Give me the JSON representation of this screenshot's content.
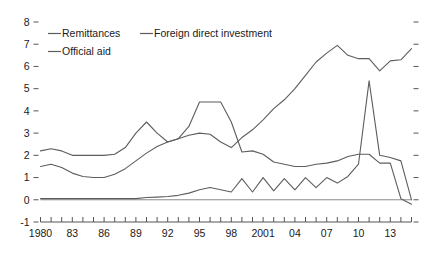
{
  "chart_data": {
    "type": "line",
    "title": "",
    "xlabel": "",
    "ylabel": "",
    "xlim": [
      1980,
      2015
    ],
    "ylim": [
      -1,
      8
    ],
    "ytick_values": [
      -1,
      0,
      1,
      2,
      3,
      4,
      5,
      6,
      7,
      8
    ],
    "ytick_labels": [
      "-1",
      "0",
      "1",
      "2",
      "3",
      "4",
      "5",
      "6",
      "7",
      "8"
    ],
    "xtick_values": [
      1980,
      1983,
      1986,
      1989,
      1992,
      1995,
      1998,
      2001,
      2004,
      2007,
      2010,
      2013
    ],
    "xtick_labels": [
      "1980",
      "83",
      "86",
      "89",
      "92",
      "95",
      "98",
      "2001",
      "04",
      "07",
      "10",
      "13"
    ],
    "x": [
      1980,
      1981,
      1982,
      1983,
      1984,
      1985,
      1986,
      1987,
      1988,
      1989,
      1990,
      1991,
      1992,
      1993,
      1994,
      1995,
      1996,
      1997,
      1998,
      1999,
      2000,
      2001,
      2002,
      2003,
      2004,
      2005,
      2006,
      2007,
      2008,
      2009,
      2010,
      2011,
      2012,
      2013,
      2014,
      2015
    ],
    "grid": false,
    "legend_position": "top-left",
    "line_color": "#5d5d5d",
    "series": [
      {
        "name": "Remittances",
        "values": [
          1.5,
          1.6,
          1.45,
          1.2,
          1.05,
          1.0,
          1.0,
          1.15,
          1.4,
          1.75,
          2.1,
          2.4,
          2.6,
          2.75,
          2.9,
          3.0,
          2.95,
          2.6,
          2.35,
          2.8,
          3.15,
          3.6,
          4.1,
          4.5,
          5.0,
          5.6,
          6.2,
          6.6,
          6.95,
          6.5,
          6.35,
          6.35,
          5.8,
          6.25,
          6.3,
          6.8
        ]
      },
      {
        "name": "Foreign direct investment",
        "values": [
          0.05,
          0.05,
          0.05,
          0.05,
          0.05,
          0.05,
          0.05,
          0.05,
          0.05,
          0.05,
          0.1,
          0.12,
          0.15,
          0.2,
          0.3,
          0.45,
          0.55,
          0.45,
          0.35,
          0.95,
          0.35,
          1.0,
          0.4,
          0.95,
          0.45,
          1.0,
          0.55,
          1.0,
          0.75,
          1.05,
          1.6,
          5.35,
          2.0,
          1.9,
          1.75,
          0.0
        ]
      },
      {
        "name": "Official aid",
        "values": [
          2.2,
          2.3,
          2.2,
          2.0,
          2.0,
          2.0,
          2.0,
          2.05,
          2.35,
          3.0,
          3.5,
          3.0,
          2.6,
          2.75,
          3.3,
          4.4,
          4.4,
          4.4,
          3.5,
          2.15,
          2.2,
          2.05,
          1.7,
          1.6,
          1.5,
          1.5,
          1.6,
          1.65,
          1.75,
          1.95,
          2.05,
          2.05,
          1.65,
          1.65,
          0.05,
          -0.2
        ]
      }
    ]
  }
}
